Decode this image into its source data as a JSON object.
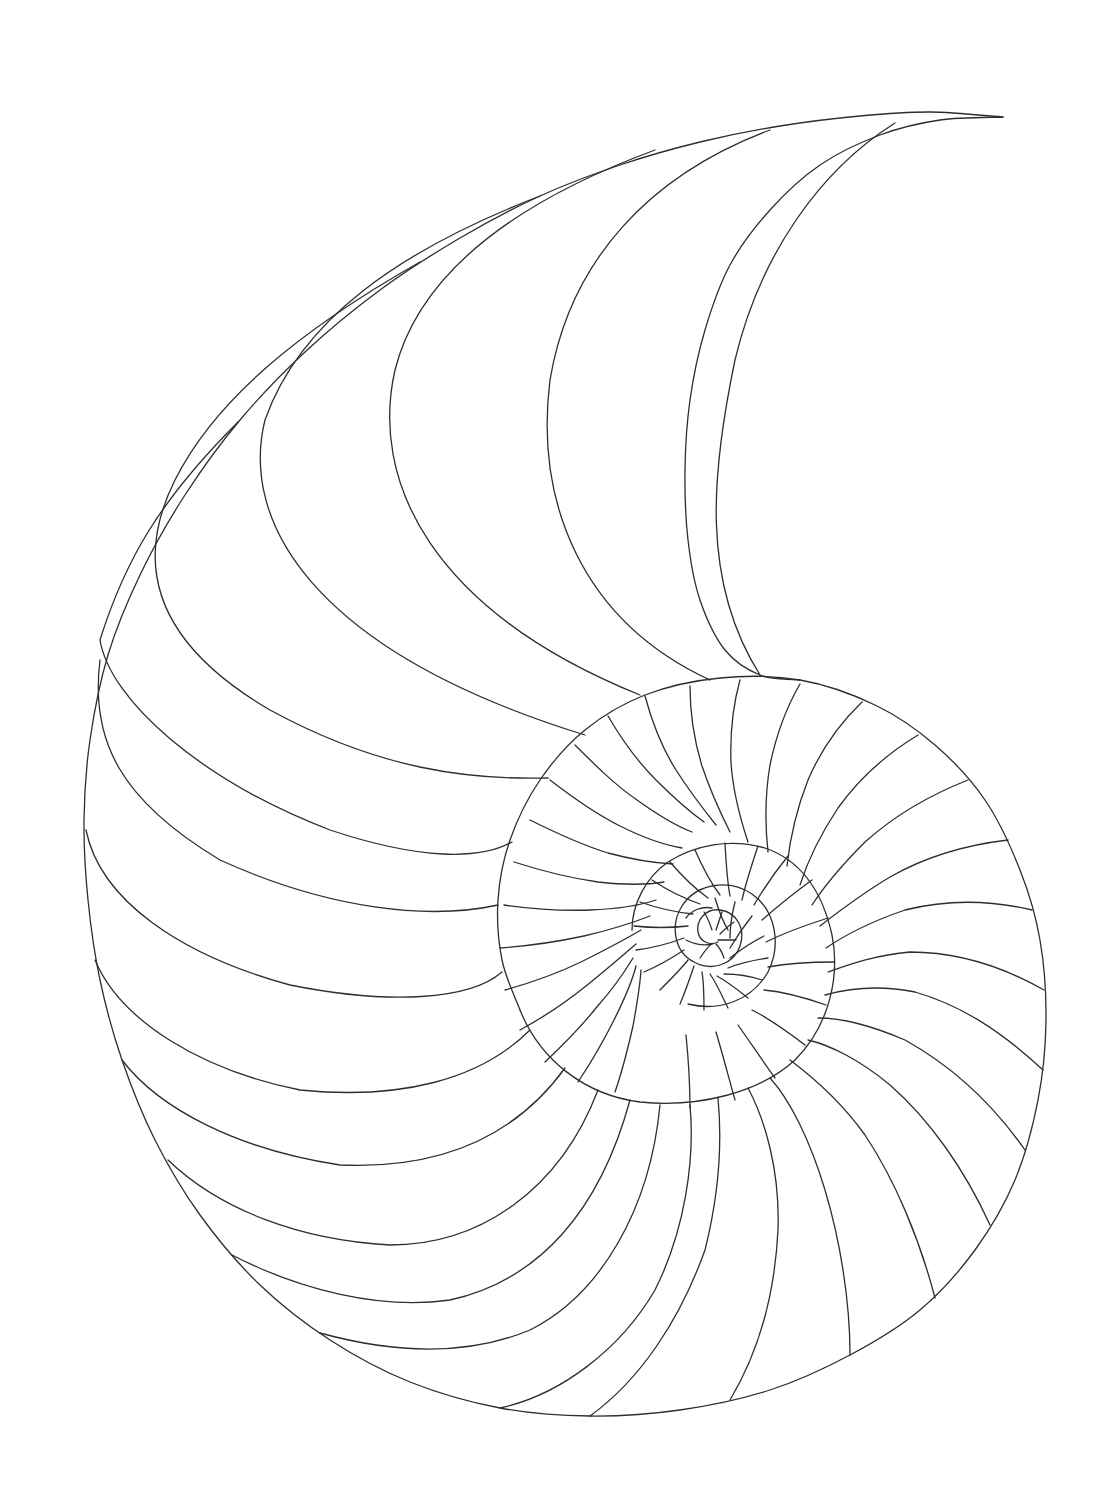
{
  "illustration": {
    "subject": "Nautilus shell spiral line drawing",
    "background": "#ffffff",
    "stroke_color": "#2e2e2e",
    "stroke_width": 1.3,
    "canvas": {
      "width": 1111,
      "height": 1504
    },
    "spiral": {
      "center": [
        690,
        936
      ],
      "growth_per_turn": 2.85,
      "inner_radius_at_start": 6,
      "start_angle_deg": 200,
      "turns": 3.05,
      "rotation_deg": 0
    },
    "outer_shell": {
      "points": [
        [
          1003,
          117
        ],
        [
          930,
          112
        ],
        [
          860,
          116
        ],
        [
          780,
          126
        ],
        [
          700,
          142
        ],
        [
          620,
          165
        ],
        [
          540,
          196
        ],
        [
          460,
          238
        ],
        [
          380,
          290
        ],
        [
          305,
          352
        ],
        [
          240,
          420
        ],
        [
          185,
          495
        ],
        [
          140,
          575
        ],
        [
          108,
          655
        ],
        [
          90,
          740
        ],
        [
          84,
          820
        ],
        [
          88,
          900
        ],
        [
          100,
          980
        ],
        [
          122,
          1060
        ],
        [
          155,
          1140
        ],
        [
          200,
          1215
        ],
        [
          260,
          1285
        ],
        [
          330,
          1340
        ],
        [
          410,
          1382
        ],
        [
          500,
          1408
        ],
        [
          590,
          1416
        ],
        [
          680,
          1410
        ],
        [
          770,
          1390
        ],
        [
          850,
          1355
        ],
        [
          920,
          1310
        ],
        [
          975,
          1250
        ],
        [
          1015,
          1180
        ],
        [
          1038,
          1100
        ],
        [
          1046,
          1020
        ],
        [
          1040,
          940
        ],
        [
          1020,
          870
        ],
        [
          985,
          800
        ],
        [
          935,
          745
        ],
        [
          875,
          705
        ],
        [
          800,
          680
        ],
        [
          720,
          678
        ],
        [
          645,
          695
        ],
        [
          585,
          730
        ],
        [
          540,
          780
        ],
        [
          510,
          840
        ],
        [
          498,
          900
        ],
        [
          502,
          960
        ],
        [
          520,
          1010
        ]
      ]
    },
    "inner_lip": {
      "points": [
        [
          1003,
          117
        ],
        [
          940,
          120
        ],
        [
          880,
          135
        ],
        [
          820,
          165
        ],
        [
          770,
          210
        ],
        [
          730,
          265
        ],
        [
          705,
          330
        ],
        [
          690,
          400
        ],
        [
          685,
          470
        ],
        [
          688,
          540
        ],
        [
          700,
          600
        ],
        [
          725,
          650
        ],
        [
          760,
          675
        ],
        [
          800,
          680
        ]
      ]
    },
    "septa_outer_whorl": [
      {
        "d": "M 895,123 C 820,170 760,255 735,360 C 712,470 700,580 760,675"
      },
      {
        "d": "M 770,130 C 650,175 570,260 550,380 C 535,500 580,620 710,680"
      },
      {
        "d": "M 655,150 C 520,200 420,270 395,370 C 370,480 430,610 640,695"
      },
      {
        "d": "M 540,196 C 400,250 300,320 265,420 C 240,520 310,650 585,735"
      },
      {
        "d": "M 420,262 C 300,330 215,400 175,480 C 135,560 150,640 270,710 C 380,770 470,780 548,778"
      },
      {
        "d": "M 238,422 C 160,500 125,560 100,640 C 110,700 200,780 330,830 C 420,860 480,860 512,842"
      },
      {
        "d": "M 100,660 C 90,740 120,800 220,860 C 330,910 430,920 498,905"
      },
      {
        "d": "M 86,830 C 100,900 180,955 290,985 C 390,1005 470,1000 502,972"
      },
      {
        "d": "M 95,960 C 120,1020 200,1070 300,1090 C 400,1100 480,1080 530,1030"
      },
      {
        "d": "M 122,1060 C 160,1110 240,1150 340,1165 C 450,1170 520,1130 565,1068"
      },
      {
        "d": "M 168,1160 C 220,1210 300,1240 390,1245 C 480,1245 560,1190 598,1090"
      },
      {
        "d": "M 232,1255 C 300,1290 380,1310 450,1300 C 540,1280 600,1210 630,1100"
      },
      {
        "d": "M 320,1333 C 400,1355 470,1355 530,1330 C 600,1295 650,1210 660,1105"
      },
      {
        "d": "M 500,1408 C 560,1395 620,1350 655,1290 C 685,1230 695,1160 690,1105"
      },
      {
        "d": "M 590,1416 C 640,1380 680,1320 705,1250 C 720,1190 722,1140 718,1098"
      },
      {
        "d": "M 730,1400 C 760,1350 775,1290 778,1230 C 780,1170 765,1120 748,1088"
      },
      {
        "d": "M 850,1355 C 850,1300 840,1240 825,1190 C 810,1140 790,1100 770,1078"
      },
      {
        "d": "M 935,1298 C 920,1240 895,1180 865,1135 C 840,1100 810,1075 790,1060"
      },
      {
        "d": "M 990,1225 C 965,1170 930,1120 890,1085 C 860,1060 830,1045 808,1040"
      },
      {
        "d": "M 1025,1150 C 990,1100 950,1065 905,1040 C 870,1025 840,1018 818,1018"
      },
      {
        "d": "M 1043,1070 C 1000,1030 960,1005 915,992 C 880,985 850,988 825,995"
      },
      {
        "d": "M 1044,990 C 1000,965 955,952 910,952 C 875,955 848,965 828,972"
      },
      {
        "d": "M 1032,910 C 990,900 945,900 905,910 C 870,922 845,935 826,948"
      },
      {
        "d": "M 1008,840 C 965,845 925,857 890,877 C 860,895 838,912 820,926"
      },
      {
        "d": "M 968,780 C 930,795 895,815 865,842 C 842,865 825,885 812,905"
      },
      {
        "d": "M 918,735 C 885,755 858,780 838,808 C 820,835 808,860 800,885"
      },
      {
        "d": "M 862,702 C 838,725 820,752 808,780 C 797,808 790,838 787,866"
      },
      {
        "d": "M 800,684 C 786,708 776,736 770,765 C 765,795 765,825 768,852"
      },
      {
        "d": "M 740,680 C 733,705 730,735 731,763 C 733,792 740,818 748,842"
      },
      {
        "d": "M 690,686 C 690,712 694,740 702,766 C 710,790 720,812 730,832"
      },
      {
        "d": "M 645,696 C 652,722 662,748 676,770 C 690,792 704,810 716,825"
      },
      {
        "d": "M 608,716 C 622,740 638,762 656,780 C 674,798 690,812 704,822"
      },
      {
        "d": "M 575,745 C 595,765 615,785 637,800 C 658,815 676,826 692,832"
      },
      {
        "d": "M 550,780 C 572,797 596,814 620,826 C 644,838 664,845 682,848"
      },
      {
        "d": "M 530,820 C 556,833 582,845 608,853 C 634,860 655,863 673,864"
      },
      {
        "d": "M 514,862 C 542,871 570,878 598,882 C 624,885 646,885 664,882"
      },
      {
        "d": "M 504,905 C 532,909 562,911 590,910 C 616,909 638,906 656,900"
      },
      {
        "d": "M 500,948 C 528,946 556,942 584,936 C 610,930 632,923 650,916"
      },
      {
        "d": "M 505,990 C 530,983 556,974 581,962 C 605,950 624,940 641,930"
      },
      {
        "d": "M 520,1030 C 542,1018 565,1003 586,986 C 606,970 622,956 636,944"
      },
      {
        "d": "M 545,1062 C 562,1046 580,1028 596,1008 C 612,990 624,973 633,958"
      },
      {
        "d": "M 578,1082 C 590,1064 603,1042 614,1020 C 624,1000 632,982 636,966"
      },
      {
        "d": "M 615,1092 C 622,1072 628,1048 633,1026 C 637,1004 640,986 641,970"
      }
    ],
    "middle_whorl": {
      "outer": "M 520,1010 C 540,1060 585,1095 640,1102 C 700,1108 760,1092 795,1060 C 830,1025 840,975 832,935 C 822,890 800,860 765,848 C 730,838 695,845 668,862 C 645,878 632,905 632,930",
      "septa": [
        {
          "d": "M 690,1108 C 690,1080 688,1055 686,1035"
        },
        {
          "d": "M 735,1100 C 728,1075 722,1052 716,1032"
        },
        {
          "d": "M 775,1078 C 762,1060 750,1042 738,1025"
        },
        {
          "d": "M 805,1045 C 788,1032 772,1020 752,1010"
        },
        {
          "d": "M 826,1005 C 806,998 786,992 764,990"
        },
        {
          "d": "M 834,962 C 812,962 790,963 768,967"
        },
        {
          "d": "M 828,918 C 806,925 786,932 766,942"
        },
        {
          "d": "M 812,880 C 794,893 778,906 762,920"
        },
        {
          "d": "M 788,856 C 775,872 764,888 754,905"
        },
        {
          "d": "M 758,846 C 752,864 746,882 742,900"
        },
        {
          "d": "M 725,843 C 726,862 727,880 730,896"
        },
        {
          "d": "M 695,850 C 702,866 710,882 720,895"
        },
        {
          "d": "M 670,862 C 682,876 694,888 708,898"
        },
        {
          "d": "M 652,880 C 667,890 683,898 700,904"
        },
        {
          "d": "M 640,902 C 657,908 674,912 693,914"
        },
        {
          "d": "M 634,926 C 652,928 670,928 688,926"
        },
        {
          "d": "M 636,950 C 652,948 668,944 684,938"
        },
        {
          "d": "M 644,972 C 658,966 672,958 684,950"
        },
        {
          "d": "M 660,990 C 670,980 680,970 688,960"
        },
        {
          "d": "M 680,1004 C 686,990 690,978 694,966"
        },
        {
          "d": "M 704,1010 C 704,996 704,984 702,972"
        },
        {
          "d": "M 728,1008 C 722,996 717,984 710,974"
        },
        {
          "d": "M 748,998 C 738,990 728,982 717,976"
        },
        {
          "d": "M 762,980 C 750,976 738,974 724,974"
        },
        {
          "d": "M 768,958 C 754,960 740,963 728,968"
        },
        {
          "d": "M 764,936 C 752,942 740,950 730,958"
        },
        {
          "d": "M 752,916 C 744,926 737,936 730,948"
        },
        {
          "d": "M 735,902 C 732,914 730,926 730,938"
        },
        {
          "d": "M 715,898 C 718,908 722,920 728,930"
        }
      ]
    },
    "inner_whorl": {
      "paths": [
        "M 688,1004 C 720,1012 752,1000 768,972 C 782,944 775,910 752,894 C 728,878 696,884 682,906 C 670,925 674,952 694,962 C 712,972 734,964 740,946 C 746,928 736,912 720,910 C 706,908 696,920 698,932 C 700,942 710,946 718,942",
        "M 686,918 C 692,910 702,906 712,908",
        "M 686,940 C 694,944 704,946 712,944",
        "M 700,958 C 704,952 708,946 712,944",
        "M 724,958 C 722,952 720,948 716,944",
        "M 736,940 C 730,940 724,940 718,940",
        "M 734,922 C 728,926 724,930 720,934",
        "M 722,912 C 720,918 718,924 716,930",
        "M 704,912 C 708,918 710,924 712,930"
      ]
    }
  }
}
